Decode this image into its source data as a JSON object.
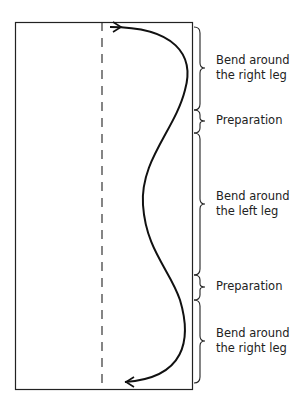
{
  "diagram": {
    "labels": [
      {
        "line1": "Bend around",
        "line2": "the right leg"
      },
      {
        "line1": "Preparation"
      },
      {
        "line1": "Bend around",
        "line2": "the left leg"
      },
      {
        "line1": "Preparation"
      },
      {
        "line1": "Bend around",
        "line2": "the right leg"
      }
    ],
    "colors": {
      "stroke": "#111111",
      "background": "#ffffff"
    }
  }
}
